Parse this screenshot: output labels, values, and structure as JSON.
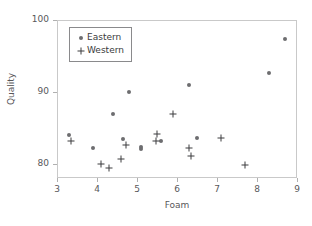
{
  "chart_data": {
    "type": "scatter",
    "title": "",
    "xlabel": "Foam",
    "ylabel": "Quality",
    "xlim": [
      3,
      9
    ],
    "ylim": [
      78,
      100
    ],
    "xticks": [
      3,
      4,
      5,
      6,
      7,
      8,
      9
    ],
    "yticks": [
      80,
      90,
      100
    ],
    "xtick_labels": [
      "3",
      "4",
      "5",
      "6",
      "7",
      "8",
      "9"
    ],
    "ytick_labels": [
      "80",
      "90",
      "100"
    ],
    "grid": false,
    "legend_position": "upper-left-inside",
    "series": [
      {
        "name": "Eastern",
        "marker": "circle",
        "color": "#6d6d70",
        "points": [
          [
            3.3,
            84.0
          ],
          [
            3.9,
            82.2
          ],
          [
            4.4,
            86.9
          ],
          [
            4.65,
            83.4
          ],
          [
            4.8,
            90.0
          ],
          [
            5.1,
            82.3
          ],
          [
            5.1,
            82.0
          ],
          [
            5.6,
            83.1
          ],
          [
            6.3,
            90.9
          ],
          [
            6.5,
            83.6
          ],
          [
            8.3,
            92.6
          ],
          [
            8.7,
            97.3
          ]
        ]
      },
      {
        "name": "Western",
        "marker": "plus",
        "color": "#3d3d3f",
        "points": [
          [
            3.35,
            83.1
          ],
          [
            4.1,
            80.0
          ],
          [
            4.3,
            79.4
          ],
          [
            4.6,
            80.6
          ],
          [
            4.72,
            82.6
          ],
          [
            5.5,
            84.1
          ],
          [
            5.48,
            83.1
          ],
          [
            5.9,
            86.9
          ],
          [
            6.3,
            82.2
          ],
          [
            6.35,
            81.0
          ],
          [
            7.1,
            83.6
          ],
          [
            7.7,
            79.8
          ]
        ]
      }
    ]
  },
  "legend": {
    "entries": [
      {
        "label": "Eastern",
        "marker": "circle-marker-icon"
      },
      {
        "label": "Western",
        "marker": "plus-marker-icon"
      }
    ]
  }
}
